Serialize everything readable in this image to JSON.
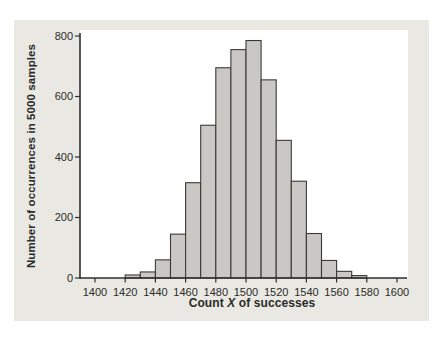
{
  "chart_data": {
    "type": "bar",
    "subtype": "histogram",
    "title": "",
    "xlabel": "Count X of successes",
    "xlabel_parts": {
      "pre": "Count ",
      "italic": "X",
      "post": " of successes"
    },
    "ylabel": "Number of occurrences in 5000 samples",
    "bins": {
      "start": 1420,
      "width": 10,
      "end": 1580
    },
    "values": [
      10,
      20,
      60,
      145,
      315,
      505,
      695,
      755,
      785,
      655,
      455,
      320,
      147,
      58,
      22,
      8
    ],
    "x_ticks": [
      1400,
      1420,
      1440,
      1460,
      1480,
      1500,
      1520,
      1540,
      1560,
      1580,
      1600
    ],
    "y_ticks": [
      0,
      200,
      400,
      600,
      800
    ],
    "xlim": [
      1390,
      1607
    ],
    "ylim": [
      0,
      810
    ],
    "grid": false,
    "legend_position": "none",
    "colors": {
      "panel_bg": "#e9e8e3",
      "plot_bg": "#ffffff",
      "bar_fill": "#c9c8c4",
      "bar_stroke": "#3a3a38",
      "axis": "#2f2f2d",
      "text": "#2b2b28"
    }
  }
}
